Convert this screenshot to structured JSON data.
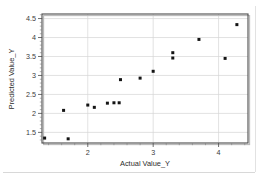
{
  "chart_data": {
    "type": "scatter",
    "title": "",
    "xlabel": "Actual Value_Y",
    "ylabel": "Predicted Value_Y",
    "xlim": [
      1.3,
      4.45
    ],
    "ylim": [
      1.22,
      4.62
    ],
    "xticks": [
      2,
      3,
      4
    ],
    "xtick_labels": [
      "2",
      "3",
      "4"
    ],
    "yticks": [
      1.5,
      2,
      2.5,
      3,
      3.5,
      4,
      4.5
    ],
    "ytick_labels": [
      "1.5",
      "2",
      "2.5",
      "3",
      "3.5",
      "4",
      "4.5"
    ],
    "grid": true,
    "grid_axis": "both",
    "legend": "none",
    "marker": "square",
    "marker_color": "#141414",
    "series": [
      {
        "name": "Predicted vs Actual",
        "points": [
          {
            "x": 1.34,
            "y": 1.35
          },
          {
            "x": 1.63,
            "y": 2.08
          },
          {
            "x": 1.7,
            "y": 1.33
          },
          {
            "x": 2.0,
            "y": 2.22
          },
          {
            "x": 2.1,
            "y": 2.16
          },
          {
            "x": 2.3,
            "y": 2.27
          },
          {
            "x": 2.4,
            "y": 2.28
          },
          {
            "x": 2.48,
            "y": 2.28
          },
          {
            "x": 2.5,
            "y": 2.89
          },
          {
            "x": 2.8,
            "y": 2.93
          },
          {
            "x": 3.0,
            "y": 3.11
          },
          {
            "x": 3.3,
            "y": 3.6
          },
          {
            "x": 3.3,
            "y": 3.46
          },
          {
            "x": 3.7,
            "y": 3.95
          },
          {
            "x": 4.1,
            "y": 3.45
          },
          {
            "x": 4.28,
            "y": 4.34
          }
        ]
      }
    ]
  },
  "axes": {
    "x_title": "Actual Value_Y",
    "y_title": "Predicted Value_Y"
  }
}
